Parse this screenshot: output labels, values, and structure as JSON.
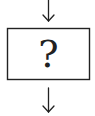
{
  "diagram": {
    "type": "flowchart-fragment",
    "nodes": [
      {
        "id": "unknown-step",
        "shape": "rectangle",
        "label": "?"
      }
    ],
    "edges": [
      {
        "from": "above",
        "to": "unknown-step",
        "direction": "down"
      },
      {
        "from": "unknown-step",
        "to": "below",
        "direction": "down"
      }
    ],
    "colors": {
      "stroke": "#222222",
      "background": "#ffffff"
    }
  }
}
